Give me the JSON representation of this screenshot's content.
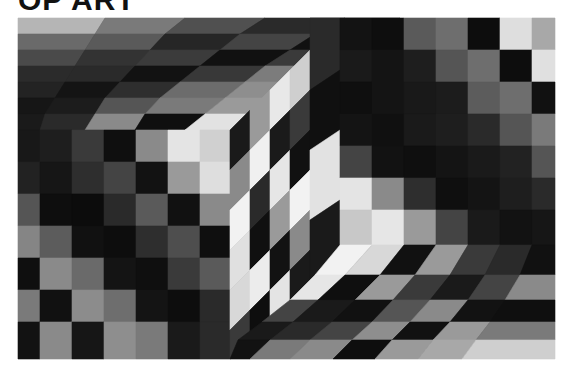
{
  "page": {
    "title": "OP ART"
  },
  "artwork": {
    "frame": {
      "x": 18,
      "y": 18,
      "width": 537,
      "height": 341
    },
    "description": "Grayscale op-art composition: a projecting cube with a checkered side face and a concave cube on a skewed checkered ground",
    "palette": {
      "black": "#0d0d0d",
      "dark": "#2a2a2a",
      "mid_dark": "#444444",
      "mid": "#6e6e6e",
      "light": "#9c9c9c",
      "pale": "#c8c8c8",
      "white": "#ececec"
    },
    "cells": [
      {
        "p": "18,18 105,18 95,34 18,34",
        "g": "#b5b5b5"
      },
      {
        "p": "105,18 185,18 165,34 95,34",
        "g": "#7a7a7a"
      },
      {
        "p": "185,18 265,18 240,34 165,34",
        "g": "#505050"
      },
      {
        "p": "265,18 345,18 315,34 240,34",
        "g": "#2a2a2a"
      },
      {
        "p": "345,18 400,18 375,34 315,34",
        "g": "#555555"
      },
      {
        "p": "18,34 95,34 85,50 18,50",
        "g": "#6a6a6a"
      },
      {
        "p": "95,34 165,34 150,50 85,50",
        "g": "#5a5a5a"
      },
      {
        "p": "165,34 240,34 220,50 150,50",
        "g": "#262626"
      },
      {
        "p": "240,34 315,34 290,50 220,50",
        "g": "#444444"
      },
      {
        "p": "315,34 375,34 350,50 290,50",
        "g": "#111111"
      },
      {
        "p": "18,50 85,50 75,66 18,66",
        "g": "#4a4a4a"
      },
      {
        "p": "85,50 150,50 135,66 75,66",
        "g": "#333333"
      },
      {
        "p": "150,50 220,50 200,66 135,66",
        "g": "#3b3b3b"
      },
      {
        "p": "220,50 290,50 265,66 200,66",
        "g": "#111111"
      },
      {
        "p": "290,50 350,50 330,66 265,66",
        "g": "#3a3a3a"
      },
      {
        "p": "18,66 75,66 65,82 18,82",
        "g": "#2b2b2b"
      },
      {
        "p": "75,66 135,66 120,82 65,82",
        "g": "#2a2a2a"
      },
      {
        "p": "135,66 200,66 180,82 120,82",
        "g": "#121212"
      },
      {
        "p": "200,66 265,66 245,82 180,82",
        "g": "#383838"
      },
      {
        "p": "265,66 330,66 305,82 245,82",
        "g": "#7c7c7c"
      },
      {
        "p": "18,82 65,82 55,98 18,98",
        "g": "#232323"
      },
      {
        "p": "65,82 120,82 105,98 55,98",
        "g": "#141414"
      },
      {
        "p": "120,82 180,82 160,98 105,98",
        "g": "#2e2e2e"
      },
      {
        "p": "180,82 245,82 225,98 160,98",
        "g": "#6c6c6c"
      },
      {
        "p": "245,82 305,82 285,98 225,98",
        "g": "#8e8e8e"
      },
      {
        "p": "18,98 55,98 45,114 18,114",
        "g": "#161616"
      },
      {
        "p": "55,98 105,98 95,114 45,114",
        "g": "#1c1c1c"
      },
      {
        "p": "105,98 160,98 145,114 95,114",
        "g": "#555555"
      },
      {
        "p": "160,98 225,98 205,114 145,114",
        "g": "#7a7a7a"
      },
      {
        "p": "225,98 285,98 265,114 205,114",
        "g": "#9a9a9a"
      },
      {
        "p": "18,114 45,114 40,130 18,130",
        "g": "#1a1a1a"
      },
      {
        "p": "45,114 95,114 85,130 40,130",
        "g": "#2a2a2a"
      },
      {
        "p": "95,114 145,114 135,130 85,130",
        "g": "#8a8a8a"
      },
      {
        "p": "145,114 205,114 185,130 135,130",
        "g": "#0f0f0f"
      },
      {
        "p": "205,114 265,114 250,130 185,130",
        "g": "#e2e2e2"
      },
      {
        "p": "18,130 40,130 40,162 18,162",
        "g": "#181818"
      },
      {
        "p": "40,130 72,130 72,162 40,162",
        "g": "#1e1e1e"
      },
      {
        "p": "72,130 104,130 104,162 72,162",
        "g": "#3a3a3a"
      },
      {
        "p": "104,130 136,130 136,162 104,162",
        "g": "#0f0f0f"
      },
      {
        "p": "136,130 168,130 168,162 136,162",
        "g": "#8a8a8a"
      },
      {
        "p": "168,130 200,130 200,162 168,162",
        "g": "#e4e4e4"
      },
      {
        "p": "200,130 230,130 230,162 200,162",
        "g": "#d0d0d0"
      },
      {
        "p": "18,162 40,162 40,194 18,194",
        "g": "#222222"
      },
      {
        "p": "40,162 72,162 72,194 40,194",
        "g": "#161616"
      },
      {
        "p": "72,162 104,162 104,194 72,194",
        "g": "#2e2e2e"
      },
      {
        "p": "104,162 136,162 136,194 104,194",
        "g": "#444444"
      },
      {
        "p": "136,162 168,162 168,194 136,194",
        "g": "#121212"
      },
      {
        "p": "168,162 200,162 200,194 168,194",
        "g": "#9a9a9a"
      },
      {
        "p": "200,162 230,162 230,194 200,194",
        "g": "#dedede"
      },
      {
        "p": "18,194 40,194 40,226 18,226",
        "g": "#555555"
      },
      {
        "p": "40,194 72,194 72,226 40,226",
        "g": "#0e0e0e"
      },
      {
        "p": "72,194 104,194 104,226 72,226",
        "g": "#0c0c0c"
      },
      {
        "p": "104,194 136,194 136,226 104,226",
        "g": "#2a2a2a"
      },
      {
        "p": "136,194 168,194 168,226 136,226",
        "g": "#5a5a5a"
      },
      {
        "p": "168,194 200,194 200,226 168,226",
        "g": "#111111"
      },
      {
        "p": "200,194 230,194 230,226 200,226",
        "g": "#8a8a8a"
      },
      {
        "p": "18,226 40,226 40,258 18,258",
        "g": "#858585"
      },
      {
        "p": "40,226 72,226 72,258 40,258",
        "g": "#5c5c5c"
      },
      {
        "p": "72,226 104,226 104,258 72,258",
        "g": "#111111"
      },
      {
        "p": "104,226 136,226 136,258 104,258",
        "g": "#0d0d0d"
      },
      {
        "p": "136,226 168,226 168,258 136,258",
        "g": "#2e2e2e"
      },
      {
        "p": "168,226 200,226 200,258 168,258",
        "g": "#4e4e4e"
      },
      {
        "p": "200,226 230,226 230,258 200,258",
        "g": "#0f0f0f"
      },
      {
        "p": "18,258 40,258 40,290 18,290",
        "g": "#0f0f0f"
      },
      {
        "p": "40,258 72,258 72,290 40,290",
        "g": "#8a8a8a"
      },
      {
        "p": "72,258 104,258 104,290 72,290",
        "g": "#6a6a6a"
      },
      {
        "p": "104,258 136,258 136,290 104,290",
        "g": "#141414"
      },
      {
        "p": "136,258 168,258 168,290 136,290",
        "g": "#0f0f0f"
      },
      {
        "p": "168,258 200,258 200,290 168,290",
        "g": "#3a3a3a"
      },
      {
        "p": "200,258 230,258 230,290 200,290",
        "g": "#5a5a5a"
      },
      {
        "p": "18,290 40,290 40,322 18,322",
        "g": "#7a7a7a"
      },
      {
        "p": "40,290 72,290 72,322 40,322",
        "g": "#111111"
      },
      {
        "p": "72,290 104,290 104,322 72,322",
        "g": "#8c8c8c"
      },
      {
        "p": "104,290 136,290 136,322 104,322",
        "g": "#6e6e6e"
      },
      {
        "p": "136,290 168,290 168,322 136,322",
        "g": "#141414"
      },
      {
        "p": "168,290 200,290 200,322 168,322",
        "g": "#0d0d0d"
      },
      {
        "p": "200,290 230,290 230,322 200,322",
        "g": "#2a2a2a"
      },
      {
        "p": "18,322 40,322 40,359 18,359",
        "g": "#121212"
      },
      {
        "p": "40,322 72,322 72,359 40,359",
        "g": "#8a8a8a"
      },
      {
        "p": "72,322 104,322 104,359 72,359",
        "g": "#161616"
      },
      {
        "p": "104,322 136,322 136,359 104,359",
        "g": "#8e8e8e"
      },
      {
        "p": "136,322 168,322 168,359 136,359",
        "g": "#7a7a7a"
      },
      {
        "p": "168,322 200,322 200,359 168,359",
        "g": "#1a1a1a"
      },
      {
        "p": "200,322 230,322 230,359 200,359",
        "g": "#2a2a2a"
      },
      {
        "p": "230,130 250,110 250,150 230,170",
        "g": "#1a1a1a"
      },
      {
        "p": "250,110 270,90 270,130 250,150",
        "g": "#9a9a9a"
      },
      {
        "p": "270,90 290,70 290,110 270,130",
        "g": "#e8e8e8"
      },
      {
        "p": "290,70 310,50 310,90 290,110",
        "g": "#cfcfcf"
      },
      {
        "p": "230,170 250,150 250,190 230,210",
        "g": "#8a8a8a"
      },
      {
        "p": "250,150 270,130 270,170 250,190",
        "g": "#f0f0f0"
      },
      {
        "p": "270,130 290,110 290,150 270,170",
        "g": "#1a1a1a"
      },
      {
        "p": "290,110 310,90 310,130 290,150",
        "g": "#3a3a3a"
      },
      {
        "p": "230,210 250,190 250,230 230,250",
        "g": "#f2f2f2"
      },
      {
        "p": "250,190 270,170 270,210 250,230",
        "g": "#2a2a2a"
      },
      {
        "p": "270,170 290,150 290,190 270,210",
        "g": "#e6e6e6"
      },
      {
        "p": "290,150 310,130 310,170 290,190",
        "g": "#111111"
      },
      {
        "p": "230,250 250,230 250,270 230,290",
        "g": "#e0e0e0"
      },
      {
        "p": "250,230 270,210 270,250 250,270",
        "g": "#101010"
      },
      {
        "p": "270,210 290,190 290,230 270,250",
        "g": "#9a9a9a"
      },
      {
        "p": "290,190 310,170 310,210 290,230",
        "g": "#f2f2f2"
      },
      {
        "p": "230,290 250,270 250,310 230,330",
        "g": "#d8d8d8"
      },
      {
        "p": "250,270 270,250 270,290 250,310",
        "g": "#ececec"
      },
      {
        "p": "270,250 290,230 290,270 270,290",
        "g": "#121212"
      },
      {
        "p": "290,230 310,210 310,250 290,270",
        "g": "#8a8a8a"
      },
      {
        "p": "230,330 250,310 250,350 230,359",
        "g": "#3a3a3a"
      },
      {
        "p": "250,310 270,290 270,330 250,350",
        "g": "#0e0e0e"
      },
      {
        "p": "270,290 290,270 290,310 270,330",
        "g": "#e4e4e4"
      },
      {
        "p": "290,270 310,250 310,290 290,310",
        "g": "#1a1a1a"
      },
      {
        "p": "310,18 340,18 340,70 310,90",
        "g": "#2a2a2a"
      },
      {
        "p": "310,90 340,70 340,130 310,150",
        "g": "#101010"
      },
      {
        "p": "310,150 340,130 340,200 310,220",
        "g": "#e2e2e2"
      },
      {
        "p": "310,220 340,200 340,260 310,280",
        "g": "#1a1a1a"
      },
      {
        "p": "310,280 340,260 340,290 310,310",
        "g": "#3a3a3a"
      },
      {
        "p": "340,18 372,18 372,50 340,50",
        "g": "#131313"
      },
      {
        "p": "372,18 404,18 404,50 372,50",
        "g": "#0e0e0e"
      },
      {
        "p": "404,18 436,18 436,50 404,50",
        "g": "#5a5a5a"
      },
      {
        "p": "436,18 468,18 468,50 436,50",
        "g": "#6e6e6e"
      },
      {
        "p": "468,18 500,18 500,50 468,50",
        "g": "#0d0d0d"
      },
      {
        "p": "500,18 532,18 532,50 500,50",
        "g": "#dedede"
      },
      {
        "p": "532,18 555,18 555,50 532,50",
        "g": "#a8a8a8"
      },
      {
        "p": "340,50 372,50 372,82 340,82",
        "g": "#1a1a1a"
      },
      {
        "p": "372,50 404,50 404,82 372,82",
        "g": "#141414"
      },
      {
        "p": "404,50 436,50 436,82 404,82",
        "g": "#1e1e1e"
      },
      {
        "p": "436,50 468,50 468,82 436,82",
        "g": "#555555"
      },
      {
        "p": "468,50 500,50 500,82 468,82",
        "g": "#6e6e6e"
      },
      {
        "p": "500,50 532,50 532,82 500,82",
        "g": "#0d0d0d"
      },
      {
        "p": "532,50 555,50 555,82 532,82",
        "g": "#e0e0e0"
      },
      {
        "p": "340,82 372,82 372,114 340,114",
        "g": "#0f0f0f"
      },
      {
        "p": "372,82 404,82 404,114 372,114",
        "g": "#141414"
      },
      {
        "p": "404,82 436,82 436,114 404,114",
        "g": "#191919"
      },
      {
        "p": "436,82 468,82 468,114 436,114",
        "g": "#1c1c1c"
      },
      {
        "p": "468,82 500,82 500,114 468,114",
        "g": "#5c5c5c"
      },
      {
        "p": "500,82 532,82 532,114 500,114",
        "g": "#6e6e6e"
      },
      {
        "p": "532,82 555,82 555,114 532,114",
        "g": "#111111"
      },
      {
        "p": "340,114 372,114 372,146 340,146",
        "g": "#141414"
      },
      {
        "p": "372,114 404,114 404,146 372,146",
        "g": "#101010"
      },
      {
        "p": "404,114 436,114 436,146 404,146",
        "g": "#1a1a1a"
      },
      {
        "p": "436,114 468,114 468,146 436,146",
        "g": "#1e1e1e"
      },
      {
        "p": "468,114 500,114 500,146 468,146",
        "g": "#2a2a2a"
      },
      {
        "p": "500,114 532,114 532,146 500,146",
        "g": "#555555"
      },
      {
        "p": "532,114 555,114 555,146 532,146",
        "g": "#7a7a7a"
      },
      {
        "p": "340,146 372,146 372,178 340,178",
        "g": "#444444"
      },
      {
        "p": "372,146 404,146 404,178 372,178",
        "g": "#121212"
      },
      {
        "p": "404,146 436,146 436,178 404,178",
        "g": "#0f0f0f"
      },
      {
        "p": "436,146 468,146 468,178 436,178",
        "g": "#141414"
      },
      {
        "p": "468,146 500,146 500,178 468,178",
        "g": "#1a1a1a"
      },
      {
        "p": "500,146 532,146 532,178 500,178",
        "g": "#222222"
      },
      {
        "p": "532,146 555,146 555,178 532,178",
        "g": "#555555"
      },
      {
        "p": "340,178 372,178 372,210 340,210",
        "g": "#e4e4e4"
      },
      {
        "p": "372,178 404,178 404,210 372,210",
        "g": "#8a8a8a"
      },
      {
        "p": "404,178 436,178 436,210 404,210",
        "g": "#2e2e2e"
      },
      {
        "p": "436,178 468,178 468,210 436,210",
        "g": "#0f0f0f"
      },
      {
        "p": "468,178 500,178 500,210 468,210",
        "g": "#141414"
      },
      {
        "p": "500,178 532,178 532,210 500,210",
        "g": "#1e1e1e"
      },
      {
        "p": "532,178 555,178 555,210 532,210",
        "g": "#2a2a2a"
      },
      {
        "p": "340,210 372,210 372,245 340,245",
        "g": "#c8c8c8"
      },
      {
        "p": "372,210 404,210 404,245 372,245",
        "g": "#e6e6e6"
      },
      {
        "p": "404,210 436,210 436,245 404,245",
        "g": "#9a9a9a"
      },
      {
        "p": "436,210 468,210 468,245 436,245",
        "g": "#444444"
      },
      {
        "p": "468,210 500,210 500,245 468,245",
        "g": "#1a1a1a"
      },
      {
        "p": "500,210 532,210 532,245 500,245",
        "g": "#121212"
      },
      {
        "p": "532,210 555,210 555,245 532,245",
        "g": "#161616"
      },
      {
        "p": "340,245 372,245 345,275 315,275",
        "g": "#f2f2f2"
      },
      {
        "p": "372,245 404,245 380,275 345,275",
        "g": "#d8d8d8"
      },
      {
        "p": "404,245 436,245 415,275 380,275",
        "g": "#111111"
      },
      {
        "p": "436,245 468,245 450,275 415,275",
        "g": "#9a9a9a"
      },
      {
        "p": "468,245 500,245 485,275 450,275",
        "g": "#3a3a3a"
      },
      {
        "p": "500,245 532,245 520,275 485,275",
        "g": "#2a2a2a"
      },
      {
        "p": "532,245 555,245 555,275 520,275",
        "g": "#111111"
      },
      {
        "p": "315,275 345,275 318,300 290,300",
        "g": "#e6e6e6"
      },
      {
        "p": "345,275 380,275 355,300 318,300",
        "g": "#0f0f0f"
      },
      {
        "p": "380,275 415,275 393,300 355,300",
        "g": "#9a9a9a"
      },
      {
        "p": "415,275 450,275 430,300 393,300",
        "g": "#3a3a3a"
      },
      {
        "p": "450,275 485,275 468,300 430,300",
        "g": "#1a1a1a"
      },
      {
        "p": "485,275 520,275 505,300 468,300",
        "g": "#444444"
      },
      {
        "p": "520,275 555,275 555,300 505,300",
        "g": "#8a8a8a"
      },
      {
        "p": "290,300 318,300 293,322 262,322",
        "g": "#444444"
      },
      {
        "p": "318,300 355,300 332,322 293,322",
        "g": "#1a1a1a"
      },
      {
        "p": "355,300 393,300 372,322 332,322",
        "g": "#111111"
      },
      {
        "p": "393,300 430,300 410,322 372,322",
        "g": "#555555"
      },
      {
        "p": "430,300 468,300 450,322 410,322",
        "g": "#8a8a8a"
      },
      {
        "p": "468,300 505,300 490,322 450,322",
        "g": "#121212"
      },
      {
        "p": "505,300 555,300 555,322 490,322",
        "g": "#0f0f0f"
      },
      {
        "p": "262,322 293,322 270,340 238,340",
        "g": "#1a1a1a"
      },
      {
        "p": "293,322 332,322 310,340 270,340",
        "g": "#2a2a2a"
      },
      {
        "p": "332,322 372,322 352,340 310,340",
        "g": "#444444"
      },
      {
        "p": "372,322 410,322 392,340 352,340",
        "g": "#8e8e8e"
      },
      {
        "p": "410,322 450,322 433,340 392,340",
        "g": "#111111"
      },
      {
        "p": "450,322 490,322 476,340 433,340",
        "g": "#9a9a9a"
      },
      {
        "p": "490,322 555,322 555,340 476,340",
        "g": "#7a7a7a"
      },
      {
        "p": "238,340 270,340 250,359 230,359",
        "g": "#121212"
      },
      {
        "p": "270,340 310,340 290,359 250,359",
        "g": "#7a7a7a"
      },
      {
        "p": "310,340 352,340 333,359 290,359",
        "g": "#8a8a8a"
      },
      {
        "p": "352,340 392,340 375,359 333,359",
        "g": "#0e0e0e"
      },
      {
        "p": "392,340 433,340 418,359 375,359",
        "g": "#9a9a9a"
      },
      {
        "p": "433,340 476,340 462,359 418,359",
        "g": "#a8a8a8"
      },
      {
        "p": "476,340 555,340 555,359 462,359",
        "g": "#cfcfcf"
      }
    ]
  }
}
